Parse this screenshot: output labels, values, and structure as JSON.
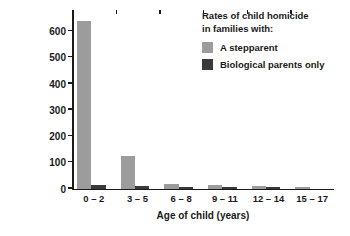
{
  "chart_data": {
    "type": "bar",
    "title": "",
    "categories": [
      "0 – 2",
      "3 – 5",
      "6 – 8",
      "9 – 11",
      "12 – 14",
      "15 – 17"
    ],
    "series": [
      {
        "name": "A stepparent",
        "color": "#9c9c9c",
        "values": [
          640,
          125,
          18,
          14,
          11,
          7
        ]
      },
      {
        "name": "Biological parents only",
        "color": "#3a3a3a",
        "values": [
          12,
          9,
          5,
          3,
          2,
          0
        ]
      }
    ],
    "xlabel": "Age of child (years)",
    "ylabel": "Rate of homicide (victims per million child-years of \"parent\"-child co-residence)",
    "ylabel_lines": [
      "Rate of homicide",
      "(victims per million child-years",
      "of \"parent\"-child co-residence)"
    ],
    "yticks": [
      0,
      100,
      200,
      300,
      400,
      500,
      600
    ],
    "ytick_labels": [
      "0",
      "100",
      "200",
      "300",
      "400",
      "500",
      "600"
    ],
    "ylim": [
      0,
      680
    ],
    "grid": false,
    "legend_position": "top-right",
    "legend": {
      "title_lines": [
        "Rates of child homicide",
        "in families with:"
      ],
      "entries": [
        "A stepparent",
        "Biological parents only"
      ]
    }
  },
  "axis": {
    "y_title_line1": "Rate of homicide",
    "y_title_line2": "(victims per million child-years",
    "y_title_line3": "of \"parent\"-child co-residence)",
    "x_title": "Age of child (years)"
  },
  "legend": {
    "title_line1": "Rates of child homicide",
    "title_line2": "in families with:",
    "entry_1": "A stepparent",
    "entry_2": "Biological parents only"
  }
}
